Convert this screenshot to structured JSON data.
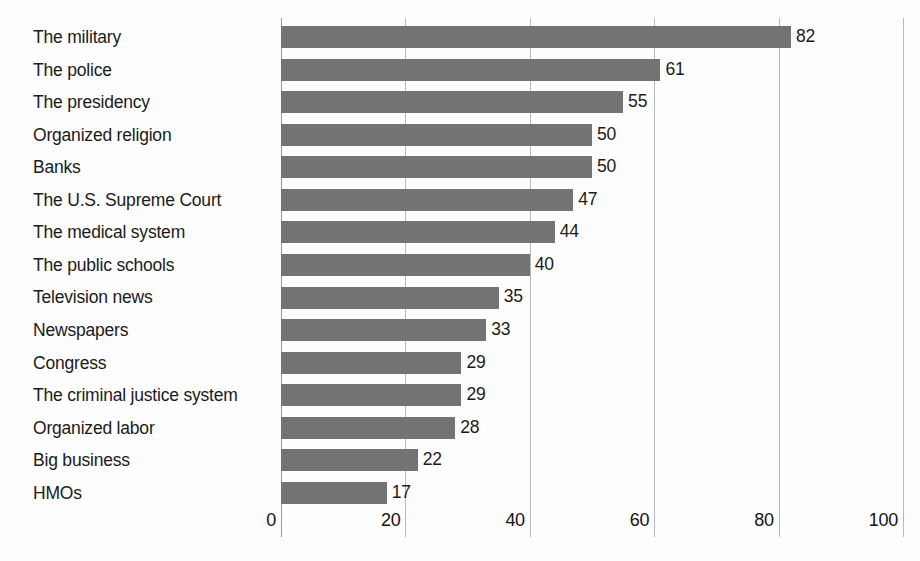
{
  "chart_data": {
    "type": "bar",
    "orientation": "horizontal",
    "title": "",
    "subtitle": "",
    "xlabel": "",
    "ylabel": "",
    "xlim": [
      0,
      100
    ],
    "xticks": [
      "0",
      "20",
      "40",
      "60",
      "80",
      "100"
    ],
    "xtick_values": [
      0,
      20,
      40,
      60,
      80,
      100
    ],
    "grid": "vertical",
    "legend": "none",
    "bar_color": "#737373",
    "grid_color": "#b9b9b9",
    "background_color": "#fdfdfd",
    "text_color": "#1b1b1b",
    "categories": [
      "The military",
      "The police",
      "The presidency",
      "Organized religion",
      "Banks",
      "The U.S. Supreme Court",
      "The medical system",
      "The public schools",
      "Television news",
      "Newspapers",
      "Congress",
      "The criminal justice system",
      "Organized labor",
      "Big business",
      "HMOs"
    ],
    "values": [
      82,
      61,
      55,
      50,
      50,
      47,
      44,
      40,
      35,
      33,
      29,
      29,
      28,
      22,
      17
    ],
    "value_labels": [
      "82",
      "61",
      "55",
      "50",
      "50",
      "47",
      "44",
      "40",
      "35",
      "33",
      "29",
      "29",
      "28",
      "22",
      "17"
    ]
  }
}
